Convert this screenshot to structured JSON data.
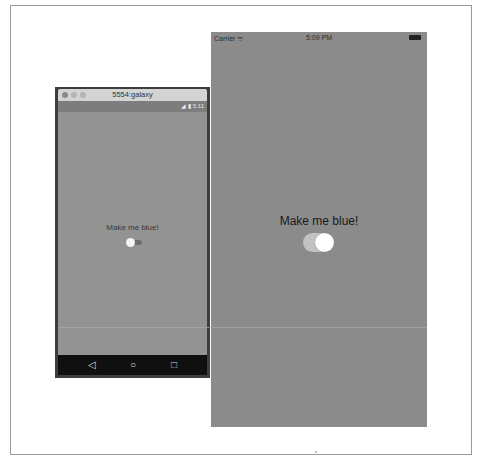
{
  "ios": {
    "status": {
      "carrier": "Carrier",
      "wifi_icon": "wifi-icon",
      "time": "5:09 PM",
      "battery_icon": "battery-icon"
    },
    "label": "Make me blue!",
    "switch": {
      "state": "on",
      "track_color": "#c2c2c2",
      "knob_color": "#ffffff"
    },
    "background": "#8b8b8b"
  },
  "android": {
    "window_title": "5554:galaxy",
    "status": {
      "icons": "◢ ▮ 5:11"
    },
    "label": "Make me blue!",
    "switch": {
      "state": "off",
      "thumb_color": "#f4f4f4",
      "track_color": "#6e6e6e"
    },
    "nav": {
      "back": "◁",
      "home": "○",
      "recents": "□"
    },
    "background": "#939393"
  }
}
